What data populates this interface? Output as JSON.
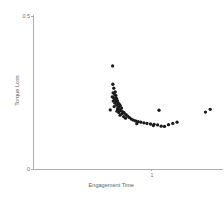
{
  "chart_data": {
    "type": "scatter",
    "title": "",
    "xlabel": "Engagement Time",
    "ylabel": "Torque Loss",
    "grid": false,
    "legend": null,
    "xlim": [
      0,
      1.6
    ],
    "ylim": [
      0,
      0.5
    ],
    "xticks": [
      {
        "value": 1,
        "label": "1"
      }
    ],
    "yticks": [
      {
        "value": 0,
        "label": "0"
      },
      {
        "value": 0.5,
        "label": "0.5"
      }
    ],
    "marker": {
      "shape": "circle",
      "color": "#1a1a1a",
      "size": 2.3
    },
    "points": [
      {
        "x": 0.668,
        "y": 0.337
      },
      {
        "x": 0.67,
        "y": 0.277
      },
      {
        "x": 0.678,
        "y": 0.264
      },
      {
        "x": 0.69,
        "y": 0.252
      },
      {
        "x": 0.672,
        "y": 0.249
      },
      {
        "x": 0.686,
        "y": 0.243
      },
      {
        "x": 0.696,
        "y": 0.24
      },
      {
        "x": 0.665,
        "y": 0.236
      },
      {
        "x": 0.676,
        "y": 0.233
      },
      {
        "x": 0.7,
        "y": 0.231
      },
      {
        "x": 0.684,
        "y": 0.229
      },
      {
        "x": 0.692,
        "y": 0.226
      },
      {
        "x": 0.707,
        "y": 0.224
      },
      {
        "x": 0.673,
        "y": 0.222
      },
      {
        "x": 0.698,
        "y": 0.22
      },
      {
        "x": 0.713,
        "y": 0.217
      },
      {
        "x": 0.688,
        "y": 0.215
      },
      {
        "x": 0.724,
        "y": 0.212
      },
      {
        "x": 0.702,
        "y": 0.209
      },
      {
        "x": 0.733,
        "y": 0.207
      },
      {
        "x": 0.681,
        "y": 0.204
      },
      {
        "x": 0.716,
        "y": 0.202
      },
      {
        "x": 0.744,
        "y": 0.199
      },
      {
        "x": 0.709,
        "y": 0.196
      },
      {
        "x": 0.727,
        "y": 0.194
      },
      {
        "x": 0.648,
        "y": 0.193
      },
      {
        "x": 0.738,
        "y": 0.191
      },
      {
        "x": 0.705,
        "y": 0.189
      },
      {
        "x": 0.755,
        "y": 0.187
      },
      {
        "x": 0.72,
        "y": 0.185
      },
      {
        "x": 0.766,
        "y": 0.183
      },
      {
        "x": 0.748,
        "y": 0.181
      },
      {
        "x": 0.781,
        "y": 0.178
      },
      {
        "x": 0.731,
        "y": 0.176
      },
      {
        "x": 0.795,
        "y": 0.173
      },
      {
        "x": 0.762,
        "y": 0.171
      },
      {
        "x": 0.81,
        "y": 0.168
      },
      {
        "x": 0.777,
        "y": 0.166
      },
      {
        "x": 0.826,
        "y": 0.163
      },
      {
        "x": 0.843,
        "y": 0.16
      },
      {
        "x": 0.862,
        "y": 0.157
      },
      {
        "x": 0.884,
        "y": 0.155
      },
      {
        "x": 0.906,
        "y": 0.153
      },
      {
        "x": 0.932,
        "y": 0.151
      },
      {
        "x": 0.958,
        "y": 0.149
      },
      {
        "x": 0.872,
        "y": 0.148
      },
      {
        "x": 0.988,
        "y": 0.147
      },
      {
        "x": 1.018,
        "y": 0.146
      },
      {
        "x": 1.048,
        "y": 0.144
      },
      {
        "x": 1.012,
        "y": 0.142
      },
      {
        "x": 1.078,
        "y": 0.14
      },
      {
        "x": 1.106,
        "y": 0.139
      },
      {
        "x": 1.06,
        "y": 0.192
      },
      {
        "x": 1.14,
        "y": 0.145
      },
      {
        "x": 1.176,
        "y": 0.149
      },
      {
        "x": 1.212,
        "y": 0.153
      },
      {
        "x": 1.452,
        "y": 0.186
      },
      {
        "x": 1.492,
        "y": 0.195
      }
    ]
  }
}
